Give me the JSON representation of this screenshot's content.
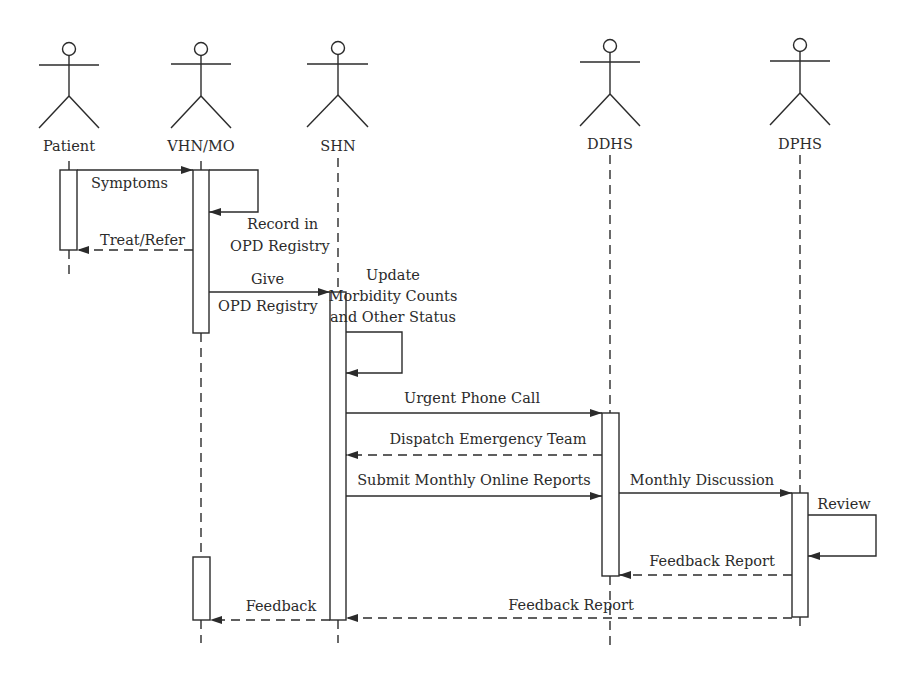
{
  "diagram": {
    "type": "UML sequence diagram",
    "actors": [
      {
        "id": "patient",
        "label": "Patient",
        "x": 69
      },
      {
        "id": "vhn_mo",
        "label": "VHN/MO",
        "x": 201
      },
      {
        "id": "shn",
        "label": "SHN",
        "x": 338
      },
      {
        "id": "ddhs",
        "label": "DDHS",
        "x": 610
      },
      {
        "id": "dphs",
        "label": "DPHS",
        "x": 800
      }
    ],
    "messages": {
      "symptoms": {
        "from": "Patient",
        "to": "VHN/MO",
        "label": "Symptoms",
        "style": "solid"
      },
      "record": {
        "from": "VHN/MO",
        "to": "VHN/MO",
        "label_line1": "Record in",
        "label_line2": "OPD Registry",
        "style": "self"
      },
      "treat": {
        "from": "VHN/MO",
        "to": "Patient",
        "label": "Treat/Refer",
        "style": "dashed"
      },
      "give": {
        "from": "VHN/MO",
        "to": "SHN",
        "label_line1": "Give",
        "label_line2": "OPD Registry",
        "style": "solid"
      },
      "update": {
        "from": "SHN",
        "to": "SHN",
        "label_line1": "Update",
        "label_line2": "Morbidity Counts",
        "label_line3": "and Other Status",
        "style": "self"
      },
      "urgent": {
        "from": "SHN",
        "to": "DDHS",
        "label": "Urgent Phone Call",
        "style": "solid"
      },
      "dispatch": {
        "from": "DDHS",
        "to": "SHN",
        "label": "Dispatch Emergency Team",
        "style": "dashed"
      },
      "submit": {
        "from": "SHN",
        "to": "DDHS",
        "label": "Submit Monthly Online Reports",
        "style": "solid"
      },
      "discussion": {
        "from": "DDHS",
        "to": "DPHS",
        "label": "Monthly Discussion",
        "style": "solid"
      },
      "review": {
        "from": "DPHS",
        "to": "DPHS",
        "label": "Review",
        "style": "self"
      },
      "feedback_report_ddhs": {
        "from": "DPHS",
        "to": "DDHS",
        "label": "Feedback Report",
        "style": "dashed"
      },
      "feedback_report_shn": {
        "from": "DPHS",
        "to": "SHN",
        "label": "Feedback Report",
        "style": "dashed"
      },
      "feedback": {
        "from": "SHN",
        "to": "VHN/MO",
        "label": "Feedback",
        "style": "dashed"
      }
    },
    "colors": {
      "stroke": "#2b2b2b",
      "background": "#ffffff"
    }
  }
}
